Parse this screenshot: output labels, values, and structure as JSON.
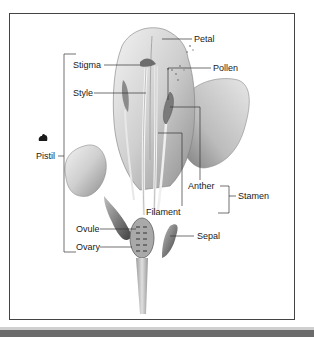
{
  "diagram": {
    "labels": {
      "petal": "Petal",
      "stigma": "Stigma",
      "pollen": "Pollen",
      "style": "Style",
      "pistil": "Pistil",
      "anther": "Anther",
      "stamen": "Stamen",
      "filament": "Filament",
      "ovule": "Ovule",
      "ovary": "Ovary",
      "sepal": "Sepal"
    },
    "groups": {
      "pistil": [
        "Stigma",
        "Style",
        "Ovule",
        "Ovary"
      ],
      "stamen": [
        "Anther",
        "Filament"
      ]
    },
    "colors": {
      "frame": "#444444",
      "leader_lines": "#333333",
      "petal_fill": "#d9d9d9",
      "petal_shade": "#9a9a9a",
      "stem": "#bdbdbd",
      "bottom_bar": "#6b6b6b"
    }
  }
}
